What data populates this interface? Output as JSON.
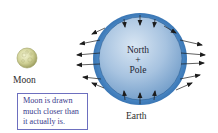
{
  "figure": {
    "earth": {
      "center_text_lines": [
        "North",
        "+",
        "Pole"
      ],
      "label": "Earth",
      "colors": {
        "bulge_ring": "#3a78b8",
        "sphere_light": "#c7d9ec",
        "sphere_mid": "#94b6d8",
        "sphere_dark": "#5f8ebf",
        "arrow": "#1c1c1c"
      }
    },
    "moon": {
      "label": "Moon",
      "colors": {
        "fill_light": "#eef0c4",
        "fill_dark": "#a9aa68"
      }
    },
    "note": {
      "lines": [
        "Moon is drawn",
        "much closer than",
        "it actually is."
      ],
      "border_color": "#6d6fbf",
      "text_color": "#3a3a8c"
    },
    "arrows": {
      "description": "Tidal force vectors: outward on near and far sides, inward at top and bottom",
      "left_side_count": 6,
      "right_side_count": 6,
      "top_count": 3,
      "bottom_count": 3
    }
  }
}
